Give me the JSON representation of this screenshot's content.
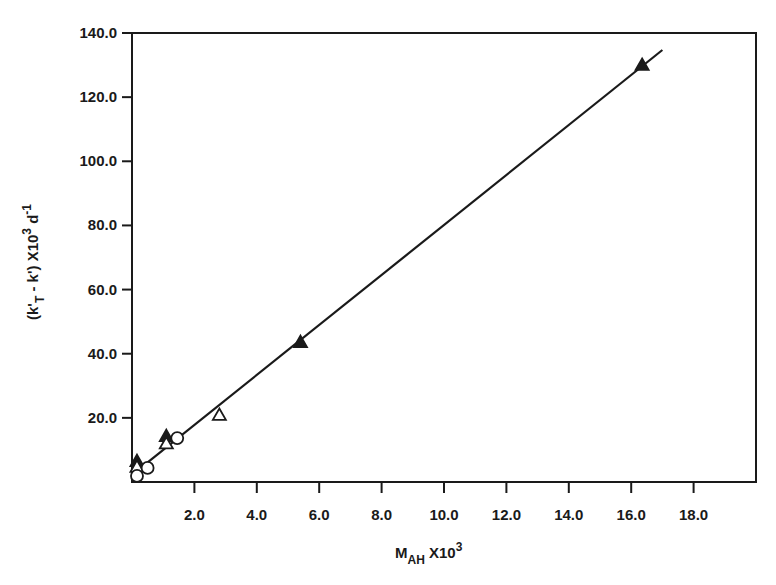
{
  "chart_data": {
    "type": "scatter",
    "title": "",
    "xlabel": "M_AH X10^3",
    "ylabel": "(k'_T - k') X10^3 d^-1",
    "xlabel_parts": {
      "main": "M",
      "sub": "AH",
      "mid": " X10",
      "sup": "3"
    },
    "ylabel_parts": {
      "a": "(k'",
      "sub": "T",
      "b": " - k') X10",
      "sup1": "3",
      "c": " d",
      "sup2": "-1"
    },
    "xlim": [
      0,
      20
    ],
    "ylim": [
      0,
      140
    ],
    "grid": false,
    "legend": null,
    "x_ticks": [
      2.0,
      4.0,
      6.0,
      8.0,
      10.0,
      12.0,
      14.0,
      16.0,
      18.0
    ],
    "x_tick_labels": [
      "2.0",
      "4.0",
      "6.0",
      "8.0",
      "10.0",
      "12.0",
      "14.0",
      "16.0",
      "18.0"
    ],
    "y_ticks": [
      20.0,
      40.0,
      60.0,
      80.0,
      100.0,
      120.0,
      140.0
    ],
    "y_tick_labels": [
      "20.0",
      "40.0",
      "60.0",
      "80.0",
      "100.0",
      "120.0",
      "140.0"
    ],
    "series": [
      {
        "name": "filled triangles",
        "marker": "filled-triangle",
        "points": [
          [
            0.16,
            6.5
          ],
          [
            1.1,
            14.3
          ],
          [
            5.4,
            43.6
          ],
          [
            16.35,
            130.0
          ]
        ]
      },
      {
        "name": "open triangles",
        "marker": "open-triangle",
        "points": [
          [
            0.16,
            4.7
          ],
          [
            1.1,
            12.0
          ],
          [
            2.8,
            20.9
          ]
        ]
      },
      {
        "name": "open circles",
        "marker": "open-circle",
        "points": [
          [
            0.16,
            1.9
          ],
          [
            0.5,
            4.4
          ],
          [
            1.45,
            13.7
          ]
        ]
      }
    ],
    "fit_line": {
      "x": [
        0.0,
        17.0
      ],
      "y": [
        2.2,
        134.7
      ]
    }
  },
  "colors": {
    "ink": "#1a1a1a",
    "background": "#ffffff"
  }
}
